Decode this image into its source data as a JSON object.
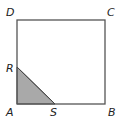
{
  "figure": {
    "type": "geometry-square",
    "colors": {
      "stroke": "#555555",
      "shade": "#a9a9a9",
      "background": "#ffffff",
      "label": "#222222"
    },
    "vertices": {
      "A": {
        "label": "A",
        "x": 17,
        "y": 104
      },
      "B": {
        "label": "B",
        "x": 105,
        "y": 104
      },
      "C": {
        "label": "C",
        "x": 105,
        "y": 20
      },
      "D": {
        "label": "D",
        "x": 17,
        "y": 20
      },
      "R": {
        "label": "R",
        "x": 17,
        "y": 67
      },
      "S": {
        "label": "S",
        "x": 55,
        "y": 104
      }
    },
    "shaded_region": "triangle ARS"
  }
}
